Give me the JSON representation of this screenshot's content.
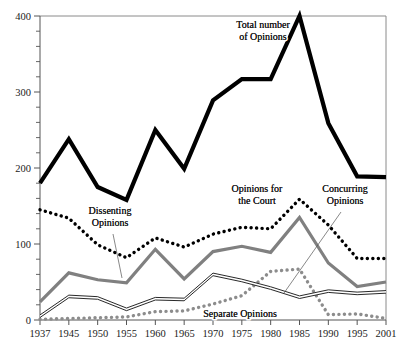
{
  "chart_data": {
    "type": "line",
    "title": "",
    "xlabel": "",
    "ylabel": "",
    "categories": [
      "1937",
      "1945",
      "1950",
      "1955",
      "1960",
      "1965",
      "1970",
      "1975",
      "1980",
      "1985",
      "1990",
      "1995",
      "2001"
    ],
    "ylim": [
      0,
      400
    ],
    "xlim": [
      0,
      12
    ],
    "grid": false,
    "legend_position": "inline-annotations",
    "y_ticks": [
      "0",
      "100",
      "200",
      "300",
      "400"
    ],
    "y_tick_values": [
      0,
      100,
      200,
      300,
      400
    ],
    "y_minor_step": 20,
    "series": [
      {
        "name": "Total number of Opinions",
        "style": "thick-solid-black",
        "color": "#000000",
        "values": [
          180,
          238,
          175,
          158,
          250,
          199,
          289,
          317,
          317,
          400,
          259,
          189,
          188
        ]
      },
      {
        "name": "Dissenting Opinions",
        "style": "thick-dotted-black",
        "color": "#000000",
        "values": [
          145,
          134,
          99,
          82,
          108,
          96,
          113,
          122,
          120,
          159,
          125,
          81,
          81
        ]
      },
      {
        "name": "Opinions for the Court",
        "style": "thick-solid-gray",
        "color": "#808080",
        "values": [
          24,
          62,
          53,
          49,
          93,
          54,
          90,
          97,
          89,
          135,
          75,
          44,
          50
        ]
      },
      {
        "name": "Concurring Opinions",
        "style": "thin-double-black",
        "color": "#111111",
        "values": [
          5,
          31,
          29,
          14,
          28,
          27,
          60,
          52,
          42,
          30,
          38,
          35,
          37
        ]
      },
      {
        "name": "Separate Opinions",
        "style": "thick-dotted-gray",
        "color": "#8c8c8c",
        "values": [
          1,
          2,
          3,
          4,
          11,
          12,
          21,
          32,
          64,
          67,
          7,
          8,
          2
        ]
      }
    ],
    "annotations": [
      {
        "id": "total",
        "text_lines": [
          "Total number",
          "of Opinions"
        ],
        "x": 263,
        "y": 28,
        "leader": null
      },
      {
        "id": "dissenting",
        "text_lines": [
          "Dissenting",
          "Opinions"
        ],
        "x": 110,
        "y": 214,
        "leader": {
          "x1": 113,
          "y1": 234,
          "x2": 122,
          "y2": 278
        }
      },
      {
        "id": "court",
        "text_lines": [
          "Opinions for",
          "the Court"
        ],
        "x": 257,
        "y": 192,
        "leader": null
      },
      {
        "id": "concurring",
        "text_lines": [
          "Concurring",
          "Opinions"
        ],
        "x": 345,
        "y": 192,
        "leader": {
          "x1": 341,
          "y1": 212,
          "x2": 284,
          "y2": 293
        }
      },
      {
        "id": "separate",
        "text_lines": [
          "Separate Opinions"
        ],
        "x": 240,
        "y": 317,
        "leader": null
      }
    ]
  },
  "axis": {
    "y_labels": [
      "400",
      "300",
      "200",
      "100",
      "0"
    ],
    "x_labels": [
      "1937",
      "1945",
      "1950",
      "1955",
      "1960",
      "1965",
      "1970",
      "1975",
      "1980",
      "1985",
      "1990",
      "1995",
      "2001"
    ]
  },
  "labels": {
    "total": {
      "line1": "Total number",
      "line2": "of Opinions"
    },
    "dissenting": {
      "line1": "Dissenting",
      "line2": "Opinions"
    },
    "court": {
      "line1": "Opinions for",
      "line2": "the Court"
    },
    "concurring": {
      "line1": "Concurring",
      "line2": "Opinions"
    },
    "separate": {
      "line1": "Separate Opinions"
    }
  },
  "colors": {
    "total": "#000000",
    "dissenting": "#000000",
    "court": "#808080",
    "concurring": "#111111",
    "separate": "#8c8c8c",
    "axis": "#555555",
    "frame": "#8a8a8a",
    "background": "#ffffff"
  }
}
